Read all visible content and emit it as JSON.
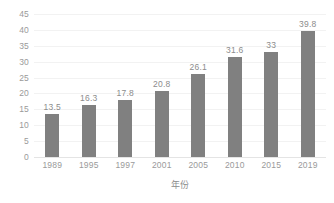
{
  "chart_data": {
    "type": "bar",
    "title": "",
    "xlabel": "年份",
    "ylabel": "",
    "categories": [
      "1989",
      "1995",
      "1997",
      "2001",
      "2005",
      "2010",
      "2015",
      "2019"
    ],
    "values": [
      13.5,
      16.3,
      17.8,
      20.8,
      26.1,
      31.6,
      33,
      39.8
    ],
    "value_labels": [
      "13.5",
      "16.3",
      "17.8",
      "20.8",
      "26.1",
      "31.6",
      "33",
      "39.8"
    ],
    "ylim": [
      0,
      45
    ],
    "yticks": [
      45,
      40,
      35,
      30,
      25,
      20,
      15,
      10,
      5,
      0
    ],
    "ytick_labels": [
      "45",
      "40",
      "35",
      "30",
      "25",
      "20",
      "15",
      "10",
      "5",
      "0"
    ],
    "grid": true,
    "legend": false,
    "series": [
      {
        "name": "",
        "values": [
          13.5,
          16.3,
          17.8,
          20.8,
          26.1,
          31.6,
          33,
          39.8
        ],
        "color": "#808080"
      }
    ],
    "colors": {
      "bar": "#808080",
      "grid": "#f2f2f2",
      "axis": "#e4e4e4",
      "tick_text": "#9a9a9a",
      "label_text": "#8c8c8c",
      "background": "#ffffff"
    }
  }
}
